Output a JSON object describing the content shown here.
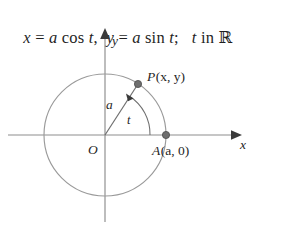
{
  "figure": {
    "equation": {
      "x_component": "x = a cos t,",
      "y_component": "y = a sin t;",
      "domain": "t in ℝ",
      "full_text": "x = a cos t,  y = a sin t;   t in ℝ",
      "parts": {
        "x_var": "x",
        "equals_1": "=",
        "radius_1": "a",
        "cos": "cos",
        "t_1": "t",
        "comma": ",",
        "y_var": "y",
        "equals_2": "=",
        "radius_2": "a",
        "sin": "sin",
        "t_2": "t",
        "semicolon": ";",
        "t_3": "t",
        "in_word": "in",
        "reals": "ℝ"
      }
    },
    "axes": {
      "x_label": "x",
      "y_label": "y",
      "origin_label": "O"
    },
    "circle": {
      "center_x": 105,
      "center_y": 117,
      "radius": 61,
      "color": "#9a9a9a"
    },
    "points": [
      {
        "name": "P",
        "label": "P(x, y)",
        "label_prefix": "P",
        "label_coords": "(x, y)",
        "cx": 138,
        "cy": 66
      },
      {
        "name": "A",
        "label": "A(a, 0)",
        "label_prefix": "A",
        "label_coords": "(a, 0)",
        "cx": 166,
        "cy": 117
      }
    ],
    "radius_segment": {
      "label": "a",
      "from": "O",
      "to": "P"
    },
    "angle": {
      "label": "t",
      "from_axis": "positive x-axis",
      "to_ray": "OP",
      "direction": "counterclockwise"
    },
    "colors": {
      "background": "#ffffff",
      "ink": "#1f1f1f",
      "curve": "#9a9a9a",
      "axis": "#8d8d8d",
      "marker": "#6e6e6e"
    }
  }
}
